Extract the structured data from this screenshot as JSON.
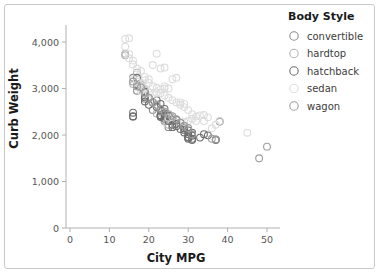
{
  "chart_data": {
    "type": "scatter",
    "title": "",
    "xlabel": "City MPG",
    "ylabel": "Curb Weight",
    "xlim": [
      0,
      52
    ],
    "ylim": [
      0,
      4300
    ],
    "xticks": [
      0,
      10,
      20,
      30,
      40,
      50
    ],
    "xtick_labels": [
      "0",
      "10",
      "20",
      "30",
      "40",
      "50"
    ],
    "yticks": [
      0,
      1000,
      2000,
      3000,
      4000
    ],
    "ytick_labels": [
      "0",
      "1,000",
      "2,000",
      "3,000",
      "4,000"
    ],
    "grid": false,
    "legend": {
      "title": "Body Style",
      "position": "right",
      "entries": [
        {
          "name": "convertible",
          "color": "#8c8c8c"
        },
        {
          "name": "hardtop",
          "color": "#b4b4b4"
        },
        {
          "name": "hatchback",
          "color": "#6e6e6e"
        },
        {
          "name": "sedan",
          "color": "#dcdcdc"
        },
        {
          "name": "wagon",
          "color": "#9e9e9e"
        }
      ]
    },
    "series": [
      {
        "name": "convertible",
        "color": "#8c8c8c",
        "points": [
          [
            19,
            2844
          ],
          [
            19,
            2778
          ],
          [
            17,
            2952
          ],
          [
            21,
            2535
          ],
          [
            25,
            2169
          ],
          [
            23,
            2425
          ],
          [
            24,
            2304
          ],
          [
            16,
            3230
          ]
        ]
      },
      {
        "name": "hardtop",
        "color": "#b4b4b4",
        "points": [
          [
            14,
            3715
          ],
          [
            14,
            3750
          ],
          [
            19,
            2976
          ],
          [
            18,
            3053
          ],
          [
            24,
            2289
          ],
          [
            25,
            2221
          ],
          [
            17,
            3340
          ],
          [
            23,
            2410
          ],
          [
            16,
            3095
          ],
          [
            22,
            2464
          ]
        ]
      },
      {
        "name": "hatchback",
        "color": "#6e6e6e",
        "points": [
          [
            16,
            2395
          ],
          [
            16,
            2403
          ],
          [
            19,
            2935
          ],
          [
            19,
            2811
          ],
          [
            23,
            2410
          ],
          [
            23,
            2425
          ],
          [
            24,
            2443
          ],
          [
            24,
            2395
          ],
          [
            26,
            2221
          ],
          [
            26,
            2169
          ],
          [
            28,
            2128
          ],
          [
            29,
            2109
          ],
          [
            30,
            1918
          ],
          [
            30,
            1944
          ],
          [
            30,
            1956
          ],
          [
            31,
            1890
          ],
          [
            31,
            1918
          ],
          [
            33,
            1944
          ],
          [
            37,
            1905
          ],
          [
            37,
            1890
          ],
          [
            38,
            2290
          ],
          [
            35,
            1992
          ],
          [
            34,
            2017
          ],
          [
            27,
            2190
          ],
          [
            27,
            2240
          ],
          [
            25,
            2300
          ],
          [
            24,
            2465
          ],
          [
            23,
            2535
          ],
          [
            22,
            2600
          ],
          [
            21,
            2700
          ],
          [
            20,
            2800
          ],
          [
            18,
            3095
          ],
          [
            17,
            3230
          ],
          [
            17,
            3075
          ],
          [
            19,
            2720
          ],
          [
            20,
            2650
          ],
          [
            25,
            2403
          ],
          [
            26,
            2337
          ],
          [
            28,
            2264
          ],
          [
            29,
            2145
          ],
          [
            31,
            2004
          ],
          [
            31,
            2050
          ],
          [
            30,
            2100
          ],
          [
            29,
            2191
          ],
          [
            24,
            2560
          ],
          [
            23,
            2670
          ],
          [
            22,
            2750
          ],
          [
            26,
            2380
          ],
          [
            27,
            2326
          ],
          [
            31,
            1985
          ],
          [
            30,
            2020
          ],
          [
            29,
            2055
          ],
          [
            23,
            2385
          ],
          [
            24,
            2348
          ],
          [
            25,
            2420
          ],
          [
            16,
            2480
          ]
        ]
      },
      {
        "name": "sedan",
        "color": "#dcdcdc",
        "points": [
          [
            14,
            4066
          ],
          [
            15,
            4080
          ],
          [
            14,
            3900
          ],
          [
            15,
            3740
          ],
          [
            16,
            3515
          ],
          [
            17,
            3430
          ],
          [
            18,
            3380
          ],
          [
            19,
            3250
          ],
          [
            19,
            3180
          ],
          [
            20,
            3120
          ],
          [
            21,
            3050
          ],
          [
            22,
            3015
          ],
          [
            22,
            3750
          ],
          [
            21,
            3505
          ],
          [
            23,
            3430
          ],
          [
            24,
            3450
          ],
          [
            27,
            3230
          ],
          [
            26,
            3200
          ],
          [
            28,
            2700
          ],
          [
            29,
            2670
          ],
          [
            31,
            2350
          ],
          [
            32,
            2300
          ],
          [
            33,
            2420
          ],
          [
            34,
            2300
          ],
          [
            36,
            2145
          ],
          [
            38,
            2300
          ],
          [
            45,
            2050
          ],
          [
            24,
            3045
          ],
          [
            24,
            3000
          ],
          [
            25,
            3000
          ],
          [
            23,
            2980
          ],
          [
            22,
            2910
          ],
          [
            21,
            2880
          ],
          [
            20,
            2910
          ],
          [
            19,
            3000
          ],
          [
            18,
            3100
          ],
          [
            17,
            3150
          ],
          [
            16,
            3200
          ],
          [
            30,
            2535
          ],
          [
            29,
            2600
          ],
          [
            28,
            2650
          ],
          [
            27,
            2700
          ],
          [
            26,
            2750
          ],
          [
            25,
            2800
          ],
          [
            24,
            2850
          ],
          [
            23,
            2900
          ],
          [
            31,
            2450
          ],
          [
            32,
            2400
          ],
          [
            34,
            2430
          ],
          [
            35,
            2380
          ],
          [
            37,
            2220
          ],
          [
            26,
            2385
          ],
          [
            25,
            2370
          ],
          [
            30,
            2300
          ],
          [
            29,
            2280
          ],
          [
            16,
            3600
          ],
          [
            15,
            3650
          ],
          [
            17,
            3050
          ],
          [
            18,
            2950
          ],
          [
            20,
            3200
          ]
        ]
      },
      {
        "name": "wagon",
        "color": "#9e9e9e",
        "points": [
          [
            17,
            3045
          ],
          [
            18,
            3020
          ],
          [
            19,
            2910
          ],
          [
            21,
            2700
          ],
          [
            22,
            2650
          ],
          [
            23,
            2560
          ],
          [
            24,
            2500
          ],
          [
            25,
            2450
          ],
          [
            26,
            2405
          ],
          [
            28,
            2265
          ],
          [
            30,
            2150
          ],
          [
            31,
            2010
          ],
          [
            37,
            1900
          ],
          [
            36,
            1918
          ],
          [
            48,
            1500
          ],
          [
            50,
            1750
          ],
          [
            20,
            2800
          ],
          [
            16,
            3150
          ],
          [
            27,
            2340
          ],
          [
            29,
            2200
          ]
        ]
      }
    ]
  }
}
